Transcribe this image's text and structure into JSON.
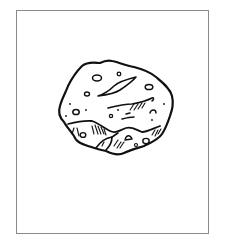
{
  "image": {
    "subject": "rock-illustration",
    "style": "black line art on white",
    "colors": {
      "background": "#ffffff",
      "frame_border": "#8a8a8a",
      "ink": "#111111"
    }
  }
}
